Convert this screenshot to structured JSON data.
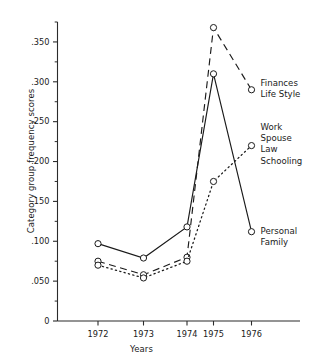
{
  "chart_data": {
    "type": "line",
    "title": "",
    "xlabel": "Years",
    "ylabel": "Category group frequency scores",
    "categories": [
      "1972",
      "1973",
      "1974",
      "1975",
      "1976"
    ],
    "x": [
      1972,
      1973,
      1974,
      1975,
      1976
    ],
    "ylim": [
      0,
      0.375
    ],
    "xlim": [
      1971.4,
      1976.8
    ],
    "grid": false,
    "legend": "inline-right-annotations",
    "ytick_labels": [
      "0",
      ".050",
      ".100",
      ".150",
      ".200",
      ".250",
      ".300",
      ".350"
    ],
    "ytick_values": [
      0,
      0.05,
      0.1,
      0.15,
      0.2,
      0.25,
      0.3,
      0.35
    ],
    "minor_ytick_values": [
      0.025,
      0.075,
      0.125,
      0.175,
      0.225,
      0.275,
      0.325,
      0.375
    ],
    "marker": "open-circle",
    "series": [
      {
        "name": "Finances Life Style",
        "label_lines": [
          "Finances",
          "Life Style"
        ],
        "style": "dashed",
        "values": [
          0.075,
          0.058,
          0.08,
          0.368,
          0.29
        ]
      },
      {
        "name": "Work Spouse Law Schooling",
        "label_lines": [
          "Work",
          "Spouse",
          "Law",
          "Schooling"
        ],
        "style": "dotted",
        "values": [
          0.07,
          0.054,
          0.075,
          0.175,
          0.22
        ]
      },
      {
        "name": "Personal Family",
        "label_lines": [
          "Personal",
          "Family"
        ],
        "style": "solid",
        "values": [
          0.097,
          0.079,
          0.118,
          0.31,
          0.112
        ]
      }
    ]
  },
  "annotations": [
    {
      "id": "finances-life-style",
      "line1": "Finances",
      "line2": "Life Style"
    },
    {
      "id": "work-spouse-law-schooling",
      "line1": "Work",
      "line2": "Spouse",
      "line3": "Law",
      "line4": "Schooling"
    },
    {
      "id": "personal-family",
      "line1": "Personal",
      "line2": "Family"
    }
  ],
  "colors": {
    "ink": "#1a1a1a",
    "axis": "#2b2b2b",
    "background": "#ffffff"
  }
}
